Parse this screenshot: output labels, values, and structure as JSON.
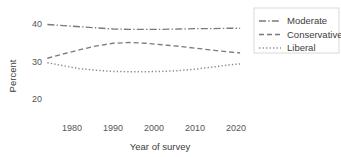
{
  "chart_data": {
    "type": "line",
    "title": "Percentage of respondents by political views",
    "xlabel": "Year of survey",
    "ylabel": "Percent",
    "xlim": [
      1972,
      2022
    ],
    "ylim": [
      18,
      42
    ],
    "xticks": [
      "1980",
      "1990",
      "2000",
      "2010",
      "2020"
    ],
    "xtick_values": [
      1980,
      1990,
      2000,
      2010,
      2020
    ],
    "yticks": [
      "40",
      "30",
      "20"
    ],
    "ytick_values": [
      40,
      30,
      20
    ],
    "grid": false,
    "legend_position": "right",
    "x": [
      1974,
      1978,
      1982,
      1986,
      1990,
      1994,
      1998,
      2002,
      2006,
      2010,
      2014,
      2018,
      2021
    ],
    "series": [
      {
        "name": "Moderate",
        "dash": "dashdot",
        "color": "#7a7a7a",
        "values": [
          40.0,
          39.7,
          39.4,
          39.1,
          38.8,
          38.7,
          38.7,
          38.7,
          38.8,
          38.9,
          38.9,
          39.0,
          39.0
        ]
      },
      {
        "name": "Conservative",
        "dash": "dashed",
        "color": "#7a7a7a",
        "values": [
          31.0,
          32.2,
          33.3,
          34.3,
          35.0,
          35.2,
          35.0,
          34.6,
          34.2,
          33.7,
          33.2,
          32.7,
          32.4
        ]
      },
      {
        "name": "Liberal",
        "dash": "dotted",
        "color": "#8a8a8a",
        "values": [
          29.8,
          29.0,
          28.2,
          27.8,
          27.5,
          27.4,
          27.4,
          27.5,
          27.7,
          28.1,
          28.6,
          29.2,
          29.5
        ]
      }
    ]
  },
  "legend": {
    "items": [
      {
        "label": "Moderate"
      },
      {
        "label": "Conservative"
      },
      {
        "label": "Liberal"
      }
    ]
  },
  "axes": {
    "y_title": "Percent",
    "x_title": "Year of survey"
  }
}
